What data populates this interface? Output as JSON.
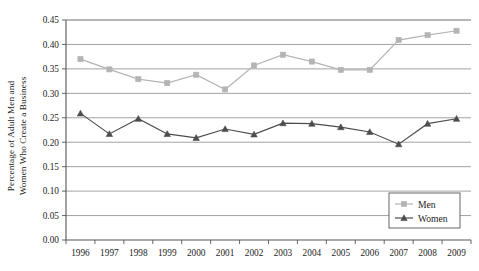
{
  "chart_data": {
    "type": "line",
    "title": "",
    "xlabel": "",
    "ylabel": "Percentage of Adult Men and Women Who Create a Business",
    "ylabel_lines": [
      "Percentage of Adult Men and",
      "Women Who Create a Business"
    ],
    "x": [
      1996,
      1997,
      1998,
      1999,
      2000,
      2001,
      2002,
      2003,
      2004,
      2005,
      2006,
      2007,
      2008,
      2009
    ],
    "categories": [
      "1996",
      "1997",
      "1998",
      "1999",
      "2000",
      "2001",
      "2002",
      "2003",
      "2004",
      "2005",
      "2006",
      "2007",
      "2008",
      "2009"
    ],
    "series": [
      {
        "name": "Men",
        "color": "#b4b4b4",
        "marker": "square",
        "values": [
          0.37,
          0.349,
          0.329,
          0.321,
          0.338,
          0.308,
          0.357,
          0.379,
          0.365,
          0.348,
          0.348,
          0.409,
          0.419,
          0.428
        ]
      },
      {
        "name": "Women",
        "color": "#4d4d4d",
        "marker": "triangle",
        "values": [
          0.259,
          0.217,
          0.248,
          0.217,
          0.209,
          0.227,
          0.216,
          0.239,
          0.238,
          0.231,
          0.221,
          0.196,
          0.238,
          0.248
        ]
      }
    ],
    "ylim": [
      0.0,
      0.45
    ],
    "yticks": [
      0.0,
      0.05,
      0.1,
      0.15,
      0.2,
      0.25,
      0.3,
      0.35,
      0.4,
      0.45
    ],
    "ytick_labels": [
      "0.00",
      "0.05",
      "0.10",
      "0.15",
      "0.20",
      "0.25",
      "0.30",
      "0.35",
      "0.40",
      "0.45"
    ],
    "grid": true,
    "grid_axis": "y",
    "legend_position": "bottom-right",
    "legend_entries": [
      "Men",
      "Women"
    ]
  },
  "legend": {
    "men_label": "Men",
    "women_label": "Women"
  },
  "colors": {
    "men": "#b4b4b4",
    "women": "#4d4d4d",
    "grid": "#999999",
    "axis": "#555555",
    "text": "#1c1c1c",
    "background": "#ffffff"
  }
}
